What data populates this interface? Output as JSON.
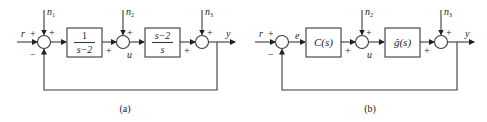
{
  "diagrams": [
    {
      "id": "a",
      "caption": "(a)",
      "input_label": "r",
      "output_label": "y",
      "signal_labels": {
        "u": "u"
      },
      "disturbances": [
        "n",
        "n",
        "n"
      ],
      "disturbance_subscripts": [
        "1",
        "2",
        "3"
      ],
      "blocks": [
        {
          "numerator": "1",
          "denominator": "s−2"
        },
        {
          "numerator": "s−2",
          "denominator": "s"
        }
      ],
      "signs": {
        "sum1_r": "+",
        "sum1_n": "+",
        "sum1_fb": "−",
        "sum2_in": "+",
        "sum2_n": "+",
        "sum3_in": "+",
        "sum3_n": "+"
      }
    },
    {
      "id": "b",
      "caption": "(b)",
      "input_label": "r",
      "output_label": "y",
      "signal_labels": {
        "e": "e",
        "u": "u"
      },
      "disturbances": [
        "n",
        "n"
      ],
      "disturbance_subscripts": [
        "2",
        "3"
      ],
      "blocks": [
        {
          "label": "C(s)"
        },
        {
          "label": "ĝ(s)"
        }
      ],
      "signs": {
        "sum1_r": "+",
        "sum1_fb": "−",
        "sum2_in": "+",
        "sum2_n": "+",
        "sum3_in": "+",
        "sum3_n": "+"
      }
    }
  ]
}
